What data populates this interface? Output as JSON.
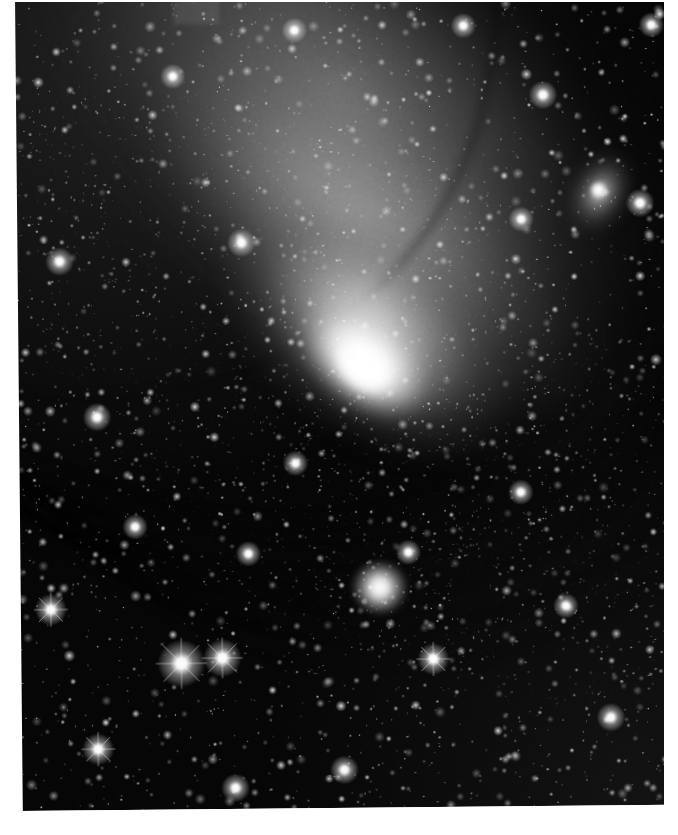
{
  "image": {
    "kind": "astronomical-photographic-plate",
    "subject": "Andromeda Galaxy (M31) with companions",
    "palette": "grayscale",
    "caption": "",
    "width": 678,
    "height": 835,
    "colors": {
      "paper": "#ffffff",
      "sky": "#060606",
      "star": "#ffffff",
      "core_highlight": "#ffffff",
      "dust_lane": "#1a1a1a",
      "disk_glow": "#b9b9b9"
    },
    "plate": {
      "left": 15,
      "top": -4,
      "width": 650,
      "height": 815,
      "rotation_deg": -0.55
    },
    "borders": {
      "left_width": 15,
      "right_width": 14,
      "top_height": 2,
      "bottom_height": 23
    }
  },
  "objects": [
    {
      "name": "M31 core",
      "label": "galactic-nucleus",
      "x": 355,
      "y": 395,
      "width": 66,
      "height": 46,
      "position_angle_deg": 39,
      "brightness": "saturated-white"
    },
    {
      "name": "M31 bulge",
      "label": "central-bulge",
      "x": 355,
      "y": 395,
      "width": 340,
      "height": 210,
      "position_angle_deg": 39,
      "brightness": "very-bright"
    },
    {
      "name": "M31 disk",
      "label": "inclined-spiral-disk",
      "x": 330,
      "y": 340,
      "width": 900,
      "height": 470,
      "position_angle_deg": 39,
      "brightness": "diffuse-gray"
    },
    {
      "name": "M110",
      "label": "companion-galaxy-upper-right",
      "x": 583,
      "y": 202,
      "width": 74,
      "height": 104,
      "position_angle_deg": 28,
      "brightness": "bright-diffuse"
    },
    {
      "name": "M32",
      "label": "companion-galaxy-lower-center",
      "x": 359,
      "y": 595,
      "width": 54,
      "height": 50,
      "position_angle_deg": 0,
      "brightness": "bright-compact"
    }
  ],
  "dust_lanes": [
    {
      "cx": 180,
      "cy": 60,
      "rx": 520,
      "ry": 430,
      "rot": 39,
      "thickness": 7,
      "opacity": 0.42
    },
    {
      "cx": 205,
      "cy": 95,
      "rx": 520,
      "ry": 430,
      "rot": 39,
      "thickness": 9,
      "opacity": 0.5
    },
    {
      "cx": 235,
      "cy": 135,
      "rx": 520,
      "ry": 430,
      "rot": 39,
      "thickness": 11,
      "opacity": 0.55
    },
    {
      "cx": 268,
      "cy": 178,
      "rx": 510,
      "ry": 420,
      "rot": 39,
      "thickness": 12,
      "opacity": 0.52
    },
    {
      "cx": 300,
      "cy": 222,
      "rx": 500,
      "ry": 410,
      "rot": 39,
      "thickness": 10,
      "opacity": 0.45
    },
    {
      "cx": -40,
      "cy": -95,
      "rx": 560,
      "ry": 455,
      "rot": 39,
      "thickness": 8,
      "opacity": 0.3
    }
  ],
  "bright_stars": [
    {
      "x": 175,
      "y": 665,
      "r": 7.5,
      "spikes": true
    },
    {
      "x": 216,
      "y": 660,
      "r": 6.0,
      "spikes": true
    },
    {
      "x": 45,
      "y": 610,
      "r": 5.0,
      "spikes": true
    },
    {
      "x": 91,
      "y": 750,
      "r": 5.0,
      "spikes": true
    },
    {
      "x": 228,
      "y": 790,
      "r": 4.5,
      "spikes": false
    },
    {
      "x": 337,
      "y": 773,
      "r": 4.5,
      "spikes": false
    },
    {
      "x": 427,
      "y": 663,
      "r": 5.0,
      "spikes": true
    },
    {
      "x": 604,
      "y": 723,
      "r": 4.5,
      "spikes": false
    },
    {
      "x": 57,
      "y": 262,
      "r": 4.5,
      "spikes": false
    },
    {
      "x": 93,
      "y": 418,
      "r": 4.5,
      "spikes": false
    },
    {
      "x": 239,
      "y": 245,
      "r": 4.5,
      "spikes": false
    },
    {
      "x": 172,
      "y": 78,
      "r": 4.0,
      "spikes": false
    },
    {
      "x": 294,
      "y": 33,
      "r": 4.0,
      "spikes": false
    },
    {
      "x": 463,
      "y": 30,
      "r": 4.0,
      "spikes": false
    },
    {
      "x": 651,
      "y": 31,
      "r": 4.0,
      "spikes": false
    },
    {
      "x": 542,
      "y": 100,
      "r": 4.5,
      "spikes": false
    },
    {
      "x": 519,
      "y": 224,
      "r": 4.0,
      "spikes": false
    },
    {
      "x": 638,
      "y": 209,
      "r": 4.5,
      "spikes": false
    },
    {
      "x": 291,
      "y": 466,
      "r": 4.0,
      "spikes": false
    },
    {
      "x": 516,
      "y": 497,
      "r": 4.0,
      "spikes": false
    },
    {
      "x": 560,
      "y": 611,
      "r": 4.0,
      "spikes": false
    },
    {
      "x": 403,
      "y": 556,
      "r": 4.0,
      "spikes": false
    },
    {
      "x": 243,
      "y": 556,
      "r": 4.0,
      "spikes": false
    },
    {
      "x": 130,
      "y": 528,
      "r": 4.0,
      "spikes": false
    }
  ],
  "star_field": {
    "total_stars": 2600,
    "halo_star_count": 1500,
    "min_radius": 0.35,
    "max_radius": 2.6,
    "seed": 20240117
  }
}
